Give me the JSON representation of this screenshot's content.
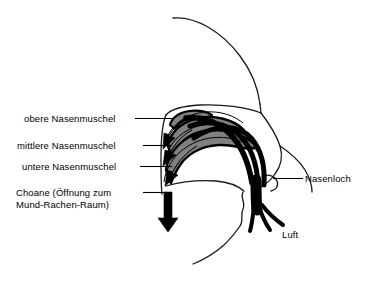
{
  "figure": {
    "background_color": "#ffffff",
    "line_color": "#000000",
    "turbinate_fill": "#808080",
    "airflow_color": "#000000"
  },
  "labels": {
    "obere_nasenmuschel": "obere Nasenmuschel",
    "mittlere_nasenmuschel": "mittlere Nasenmuschel",
    "untere_nasenmuschel": "untere Nasenmuschel",
    "choane_line1": "Choane (Öffnung zum",
    "choane_line2": "Mund-Rachen-Raum)",
    "nasenloch": "Nasenloch",
    "luft": "Luft"
  },
  "structures": {
    "head_outline": "Kopfumriss",
    "turbinates": [
      {
        "name": "obere Nasenmuschel",
        "fill": "#808080"
      },
      {
        "name": "mittlere Nasenmuschel",
        "fill": "#808080"
      },
      {
        "name": "untere Nasenmuschel",
        "fill": "#808080"
      }
    ],
    "airflow_arrows": 3,
    "choane_arrow": 1,
    "nostril": "Nasenloch"
  }
}
